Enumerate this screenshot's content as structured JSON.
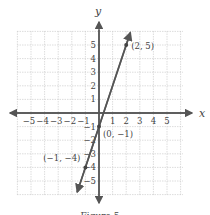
{
  "chart_data": {
    "type": "line",
    "title": "",
    "caption": "Figure 5",
    "xlabel": "x",
    "ylabel": "y",
    "xlim": [
      -6,
      6
    ],
    "ylim": [
      -6,
      6
    ],
    "grid": true,
    "x_ticks": [
      "−5",
      "−4",
      "−3",
      "−2",
      "−1",
      "1",
      "2",
      "3",
      "4",
      "5"
    ],
    "y_ticks": [
      "5",
      "4",
      "3",
      "2",
      "1",
      "−1",
      "−2",
      "−3",
      "−4",
      "−5"
    ],
    "series": [
      {
        "name": "y = 3x − 1",
        "slope": 3,
        "intercept": -1,
        "color": "#555555"
      }
    ],
    "points": [
      {
        "x": 2,
        "y": 5,
        "label": "(2, 5)"
      },
      {
        "x": 0,
        "y": -1,
        "label": "(0, −1)"
      },
      {
        "x": -1,
        "y": -4,
        "label": "(−1, −4)"
      }
    ]
  }
}
